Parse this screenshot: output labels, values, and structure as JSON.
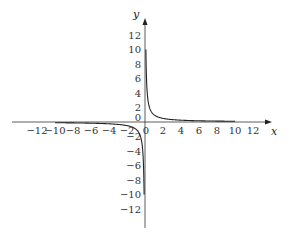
{
  "chart_data": {
    "type": "line",
    "title": "",
    "function": "y = 1/x",
    "xlabel": "x",
    "ylabel": "y",
    "xlim": [
      -13.5,
      13.5
    ],
    "ylim": [
      -13.5,
      14
    ],
    "grid": false,
    "legend": null,
    "x_ticks": [
      -12,
      -10,
      -8,
      -6,
      -4,
      -2,
      0,
      2,
      4,
      6,
      8,
      10,
      12
    ],
    "y_ticks": [
      -12,
      -10,
      -8,
      -6,
      -4,
      -2,
      0,
      2,
      4,
      6,
      8,
      10,
      12
    ],
    "x_tick_labels": [
      "−12",
      "−10",
      "−8",
      "−6",
      "−4",
      "−2",
      "0",
      "2",
      "4",
      "6",
      "8",
      "10",
      "12"
    ],
    "y_tick_labels": [
      "−12",
      "−10",
      "−8",
      "−6",
      "−4",
      "−2",
      "0",
      "2",
      "4",
      "6",
      "8",
      "10",
      "12"
    ],
    "series": [
      {
        "name": "branch-negative",
        "x": [
          -10,
          -8,
          -6,
          -4,
          -3,
          -2,
          -1.5,
          -1,
          -0.75,
          -0.5,
          -0.4,
          -0.3,
          -0.25,
          -0.2,
          -0.15,
          -0.125,
          -0.1
        ],
        "y": [
          -0.1,
          -0.125,
          -0.167,
          -0.25,
          -0.333,
          -0.5,
          -0.667,
          -1,
          -1.333,
          -2,
          -2.5,
          -3.333,
          -4,
          -5,
          -6.667,
          -8,
          -10
        ]
      },
      {
        "name": "branch-positive",
        "x": [
          0.1,
          0.125,
          0.15,
          0.2,
          0.25,
          0.3,
          0.4,
          0.5,
          0.75,
          1,
          1.5,
          2,
          3,
          4,
          6,
          8,
          10
        ],
        "y": [
          10,
          8,
          6.667,
          5,
          4,
          3.333,
          2.5,
          2,
          1.333,
          1,
          0.667,
          0.5,
          0.333,
          0.25,
          0.167,
          0.125,
          0.1
        ]
      }
    ],
    "colors": {
      "axis": "#333333",
      "curve": "#222222",
      "text": "#333333"
    }
  }
}
